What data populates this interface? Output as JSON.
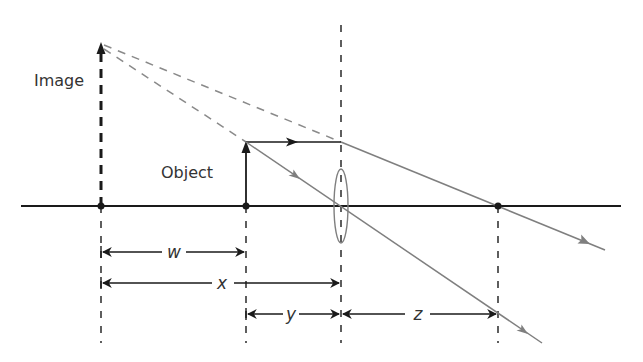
{
  "labels": {
    "image": "Image",
    "object": "Object",
    "w": "w",
    "x": "x",
    "y": "y",
    "z": "z"
  },
  "colors": {
    "black": "#1a1a1a",
    "ray_gray": "#7f7f7f",
    "dash_gray": "#8a8a8a",
    "background": "#ffffff"
  },
  "geometry": {
    "axis": {
      "x1": 21,
      "x2": 621,
      "y": 206
    },
    "image_x": 101,
    "image_top": 43,
    "object_x": 246,
    "object_top": 142,
    "lens_x": 341,
    "lens_top": 25,
    "focal_x": 498,
    "dash_bottom": 343,
    "dim_w_y": 252,
    "dim_x_y": 283,
    "dim_yz_y": 314,
    "upper_ray_end": {
      "x": 605,
      "y": 250
    },
    "lower_ray_end": {
      "x": 542,
      "y": 343
    }
  }
}
